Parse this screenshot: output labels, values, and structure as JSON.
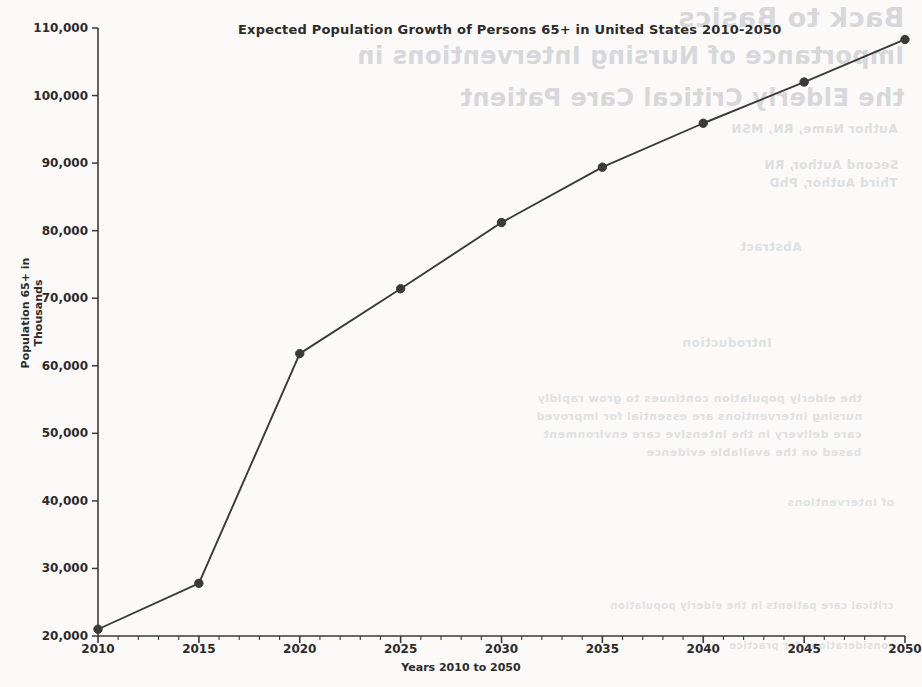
{
  "chart_data": {
    "type": "line",
    "title": "Expected Population Growth of Persons 65+ in United States 2010-2050",
    "xlabel": "Years 2010 to 2050",
    "ylabel": "Population 65+ in Thousands",
    "x": [
      2010,
      2015,
      2020,
      2025,
      2030,
      2035,
      2040,
      2045,
      2050
    ],
    "values": [
      21000,
      27800,
      61800,
      71400,
      81200,
      89400,
      95900,
      102000,
      108300
    ],
    "xtick_labels": [
      "2010",
      "2015",
      "2020",
      "2025",
      "2030",
      "2035",
      "2040",
      "2045",
      "2050"
    ],
    "ytick_labels": [
      "110,000",
      "100,000",
      "90,000",
      "80,000",
      "70,000",
      "60,000",
      "50,000",
      "40,000",
      "30,000",
      "20,000"
    ],
    "ytick_values": [
      110000,
      100000,
      90000,
      80000,
      70000,
      60000,
      50000,
      40000,
      30000,
      20000
    ],
    "xlim": [
      2010,
      2050
    ],
    "ylim": [
      20000,
      110000
    ],
    "grid": false,
    "legend": false,
    "minor_tick_step_years": 1,
    "major_tick_step_years": 5,
    "line_color": "#3a3a3a",
    "marker_color": "#3a3a3a",
    "marker": "circle",
    "background_color": "#fbfaf8"
  },
  "scan_artifacts": {
    "note": "faint mirrored bleed-through text from reverse side of scanned page",
    "lines": [
      "Back to Basics",
      "Importance of Nursing Interventions in",
      "the Elderly Critical Care Patient",
      "Author Name, RN, MSN",
      "Second Author, RN",
      "Third Author, PhD",
      "Abstract",
      "Introduction",
      "the elderly population continues to grow rapidly",
      "nursing interventions are essential for improved",
      "care delivery in the intensive care environment",
      "based on the available evidence",
      "of interventions",
      "critical care patients in the elderly population",
      "considerations for practice"
    ]
  }
}
